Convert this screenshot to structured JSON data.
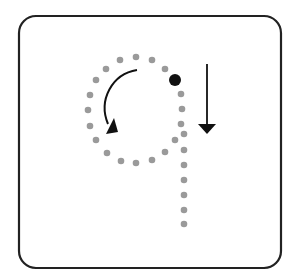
{
  "diagram": {
    "title": "Letter q tracing guide",
    "letter": "q",
    "colors": {
      "frame": "#222222",
      "guide_dot": "#9a9a9a",
      "start_dot": "#111111",
      "arrow": "#111111",
      "background": "#ffffff"
    },
    "frame": {
      "x": 19,
      "y": 16,
      "width": 262,
      "height": 252,
      "radius": 17
    },
    "start_point": {
      "x": 175,
      "y": 80,
      "r": 6
    },
    "bowl_dots": [
      [
        136,
        57
      ],
      [
        152,
        60
      ],
      [
        165,
        69
      ],
      [
        181,
        94
      ],
      [
        182,
        109
      ],
      [
        181,
        124
      ],
      [
        175,
        140
      ],
      [
        165,
        152
      ],
      [
        152,
        160
      ],
      [
        136,
        163
      ],
      [
        121,
        161
      ],
      [
        107,
        153
      ],
      [
        96,
        140
      ],
      [
        90,
        126
      ],
      [
        88,
        110
      ],
      [
        90,
        95
      ],
      [
        96,
        80
      ],
      [
        106,
        69
      ],
      [
        120,
        60
      ]
    ],
    "stem_dots": [
      [
        184,
        134
      ],
      [
        184,
        150
      ],
      [
        184,
        165
      ],
      [
        184,
        180
      ],
      [
        184,
        195
      ],
      [
        184,
        210
      ],
      [
        184,
        224
      ]
    ],
    "curved_arrow": {
      "path": "M137,70 C112,74 98,100 108,124",
      "head_tip": [
        106,
        134
      ]
    },
    "straight_arrow": {
      "x": 207,
      "y1": 64,
      "y2": 124,
      "head_tip_y": 134
    }
  }
}
